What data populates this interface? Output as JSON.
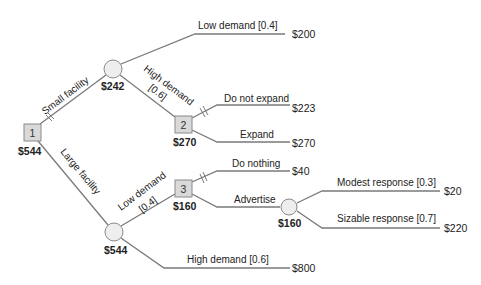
{
  "diagram": {
    "type": "decision-tree",
    "nodes": {
      "decision_1": {
        "label": "1",
        "value": "$544"
      },
      "chance_small": {
        "value": "$242"
      },
      "decision_2": {
        "label": "2",
        "value": "$270"
      },
      "chance_large": {
        "value": "$544"
      },
      "decision_3": {
        "label": "3",
        "value": "$160"
      },
      "chance_advertise": {
        "value": "$160"
      }
    },
    "branches": {
      "small_facility": "Small facility",
      "large_facility": "Large facility",
      "small_low_demand": "Low demand [0.4]",
      "small_high_demand_l1": "High demand",
      "small_high_demand_l2": "[0.6]",
      "do_not_expand": "Do not expand",
      "expand": "Expand",
      "large_low_demand_l1": "Low demand",
      "large_low_demand_l2": "[0.4]",
      "large_high_demand": "High demand [0.6]",
      "do_nothing": "Do nothing",
      "advertise": "Advertise",
      "modest_response": "Modest response [0.3]",
      "sizable_response": "Sizable response [0.7]"
    },
    "payoffs": {
      "small_low": "$200",
      "do_not_expand": "$223",
      "expand": "$270",
      "do_nothing": "$40",
      "modest": "$20",
      "sizable": "$220",
      "large_high": "$800"
    },
    "colors": {
      "line": "#7a7a7a",
      "decision_fill": "#d9d9d9",
      "chance_fill": "#eeeeee",
      "text": "#222222"
    }
  }
}
